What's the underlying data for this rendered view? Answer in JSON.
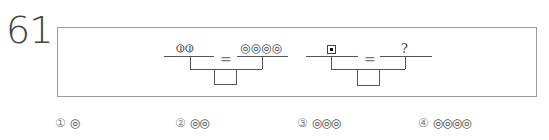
{
  "question": {
    "number": "61",
    "equations": [
      {
        "left_symbol": "⦶⦶",
        "left_symbol_name": "two circles with vertical bar",
        "operator": "=",
        "right_symbol": "◎◎◎◎",
        "right_symbol_name": "four concentric circles"
      },
      {
        "left_symbol": "▣",
        "left_symbol_name": "square with filled center",
        "operator": "=",
        "right_symbol": "?"
      }
    ],
    "options": [
      {
        "number": "①",
        "value": "◎"
      },
      {
        "number": "②",
        "value": "◎◎"
      },
      {
        "number": "③",
        "value": "◎◎◎"
      },
      {
        "number": "④",
        "value": "◎◎◎◎"
      }
    ]
  }
}
